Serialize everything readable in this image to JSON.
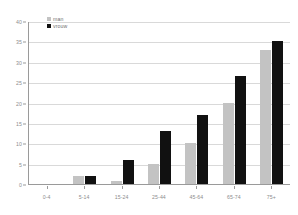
{
  "chart_data": {
    "type": "bar",
    "title": "",
    "subtitle": "",
    "xlabel": "",
    "ylabel": "",
    "ylim": [
      0,
      40
    ],
    "ytick_step": 5,
    "grid": true,
    "legend_position": "top-left-inside",
    "categories": [
      "0-4",
      "5-14",
      "15-24",
      "25-44",
      "45-64",
      "65-74",
      "75+"
    ],
    "series": [
      {
        "name": "man",
        "color": "#c3c3c3",
        "values": [
          0,
          2,
          0.8,
          5,
          10,
          20,
          33
        ]
      },
      {
        "name": "vrouw",
        "color": "#111111",
        "values": [
          0,
          2,
          6,
          13,
          17,
          26.5,
          35
        ]
      }
    ],
    "yticks": [
      "0",
      "5",
      "10",
      "15",
      "20",
      "25",
      "30",
      "35",
      "40"
    ]
  },
  "legend": {
    "items": [
      {
        "label": "man",
        "swatch": "legend-swatch-man"
      },
      {
        "label": "vrouw",
        "swatch": "legend-swatch-vrouw"
      }
    ]
  },
  "colors": {
    "series_man": "#c3c3c3",
    "series_vrouw": "#111111",
    "gridline": "#d9d9d9",
    "axis": "#9a9a9a",
    "tick_label": "#8d8d8d",
    "background": "#ffffff"
  }
}
